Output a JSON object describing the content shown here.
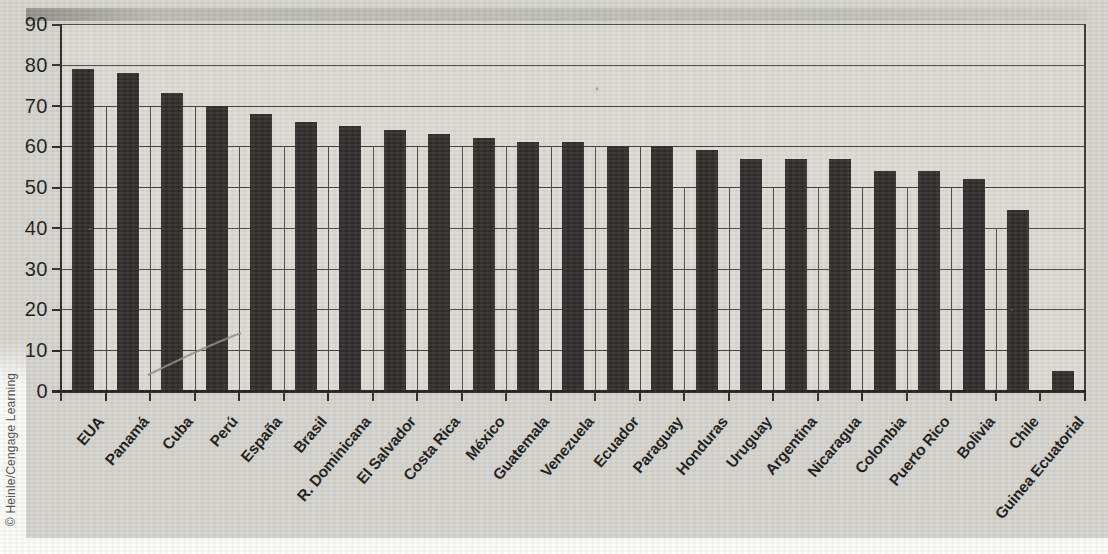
{
  "credit": "© Heinle/Cengage Learning",
  "chart_data": {
    "type": "bar",
    "title": "",
    "xlabel": "",
    "ylabel": "",
    "categories": [
      "EUA",
      "Panamá",
      "Cuba",
      "Perú",
      "España",
      "Brasil",
      "R. Dominicana",
      "El Salvador",
      "Costa Rica",
      "México",
      "Guatemala",
      "Venezuela",
      "Ecuador",
      "Paraguay",
      "Honduras",
      "Uruguay",
      "Argentina",
      "Nicaragua",
      "Colombia",
      "Puerto Rico",
      "Bolivia",
      "Chile",
      "Guinea Ecuatorial"
    ],
    "values": [
      79,
      78,
      73,
      70,
      68,
      66,
      65,
      64,
      63,
      62,
      61,
      61,
      60,
      60,
      59,
      57,
      57,
      57,
      54,
      54,
      52,
      44.5,
      5
    ],
    "ylim": [
      0,
      90
    ],
    "ytick_interval": 10,
    "yticks": [
      90,
      80,
      70,
      60,
      50,
      40,
      30,
      20,
      10,
      0
    ],
    "grid": "horizontal-major-plus-category-boundaries",
    "legend": "none",
    "colors": {
      "bar": "#2e2c2a",
      "plot_background": "#dbdad5",
      "page_background": "#d4d3ce",
      "gridline": "#45443f",
      "text": "#1c1b19",
      "credit_text": "#504f4d"
    }
  }
}
